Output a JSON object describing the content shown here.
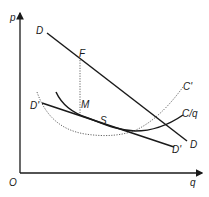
{
  "diagram": {
    "axes": {
      "y_label": "p",
      "x_label": "q",
      "origin_label": "O"
    },
    "curves": {
      "demand": {
        "label_start": "D",
        "label_end": "D"
      },
      "demand_prime": {
        "label_start": "D'",
        "label_end": "D'"
      },
      "average_cost": {
        "label": "C/q"
      },
      "marginal_cost": {
        "label": "C'"
      }
    },
    "points": {
      "F": "F",
      "M": "M",
      "S": "S"
    },
    "colors": {
      "line": "#1a1a1a",
      "dotted": "#555555"
    }
  }
}
